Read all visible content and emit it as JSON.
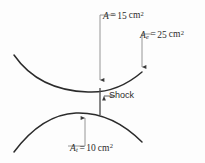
{
  "figure": {
    "name": "converging-diverging-nozzle-with-normal-shock",
    "background_color": "#fdfdfd",
    "line_color": "#2b2b2b",
    "leader_color": "#6b6b6b"
  },
  "labels": {
    "area_shock": {
      "symbol": "A",
      "subscript": "",
      "equals": "=",
      "value": "15",
      "unit": "cm",
      "exponent": "2",
      "text": "A = 15 cm2"
    },
    "area_exit": {
      "symbol": "A",
      "subscript": "e",
      "equals": "=",
      "value": "25",
      "unit": "cm",
      "exponent": "2",
      "text": "Ae = 25 cm2"
    },
    "area_throat": {
      "symbol": "A",
      "subscript": "t",
      "equals": "=",
      "value": "10",
      "unit": "cm",
      "exponent": "2",
      "text": "At = 10 cm2"
    },
    "shock": {
      "text": "Shock"
    }
  },
  "geometry": {
    "upper_wall": "M 14,55 C 30,78 55,91 88,92 C 110,93 128,84 142,72",
    "lower_wall": "M 14,152 C 32,128 52,114 76,113 C 104,112 126,126 142,142",
    "shock_line": {
      "x": 100,
      "y_top": 88,
      "y_bottom": 115
    },
    "leader_area_shock": "M 100,73 L 100,15 L 116,15",
    "leader_area_exit": "M 142,72 L 142,34 L 152,34",
    "leader_area_throat": "M 85,113 L 85,146 L 68,146",
    "leader_shock": "M 103,96 L 116,96"
  }
}
